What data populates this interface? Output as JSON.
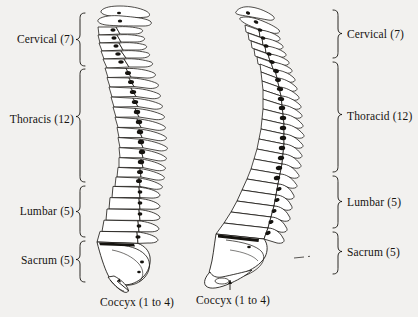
{
  "figure": {
    "background_color": "#f2f1ef",
    "ink_color": "#15130f",
    "views": [
      {
        "name": "left-view",
        "side": "left"
      },
      {
        "name": "right-view",
        "side": "right"
      }
    ]
  },
  "left_view": {
    "regions": [
      {
        "key": "cervical",
        "label": "Cervical  (7)",
        "count": 7,
        "brace_top": 13,
        "brace_bottom": 66
      },
      {
        "key": "thoracic",
        "label": "Thoracis  (12)",
        "count": 12,
        "brace_top": 69,
        "brace_bottom": 182
      },
      {
        "key": "lumbar",
        "label": "Lumbar  (5)",
        "count": 5,
        "brace_top": 186,
        "brace_bottom": 237
      },
      {
        "key": "sacrum",
        "label": "Sacrum  (5)",
        "count": 5,
        "brace_top": 241,
        "brace_bottom": 282
      }
    ],
    "callout": {
      "key": "coccyx",
      "label": "Coccyx  (1 to 4)",
      "count": "1 to 4"
    }
  },
  "right_view": {
    "regions": [
      {
        "key": "cervical",
        "label": "Cervical  (7)",
        "count": 7,
        "brace_top": 10,
        "brace_bottom": 58
      },
      {
        "key": "thoracic",
        "label": "Thoracid  (12)",
        "count": 12,
        "brace_top": 62,
        "brace_bottom": 172
      },
      {
        "key": "lumbar",
        "label": "Lumbar  (5)",
        "count": 5,
        "brace_top": 176,
        "brace_bottom": 228
      },
      {
        "key": "sacrum",
        "label": "Sacrum  (5)",
        "count": 5,
        "brace_top": 232,
        "brace_bottom": 274
      }
    ],
    "callout": {
      "key": "coccyx",
      "label": "Coccyx  (1 to 4)",
      "count": "1 to 4"
    }
  }
}
